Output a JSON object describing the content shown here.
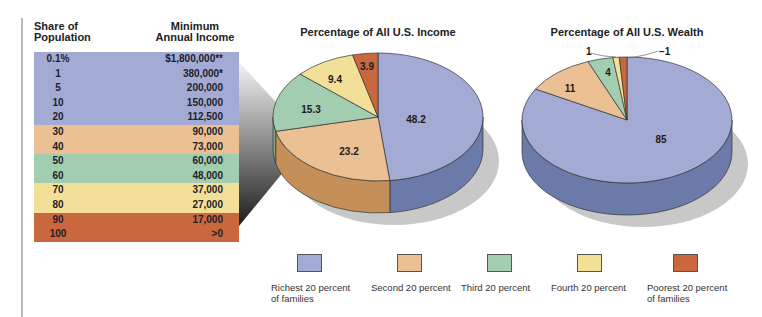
{
  "table": {
    "headers": {
      "share": [
        "Share of",
        "Population"
      ],
      "min_income": [
        "Minimum",
        "Annual Income"
      ]
    },
    "rows": [
      {
        "share": "0.1%",
        "income": "$1,800,000**",
        "group": "richest"
      },
      {
        "share": "1",
        "income": "380,000*",
        "group": "richest"
      },
      {
        "share": "5",
        "income": "200,000",
        "group": "richest"
      },
      {
        "share": "10",
        "income": "150,000",
        "group": "richest"
      },
      {
        "share": "20",
        "income": "112,500",
        "group": "richest"
      },
      {
        "share": "30",
        "income": "90,000",
        "group": "second"
      },
      {
        "share": "40",
        "income": "73,000",
        "group": "second"
      },
      {
        "share": "50",
        "income": "60,000",
        "group": "third"
      },
      {
        "share": "60",
        "income": "48,000",
        "group": "third"
      },
      {
        "share": "70",
        "income": "37,000",
        "group": "fourth"
      },
      {
        "share": "80",
        "income": "27,000",
        "group": "fourth"
      },
      {
        "share": "90",
        "income": "17,000",
        "group": "poorest"
      },
      {
        "share": "100",
        "income": ">0",
        "group": "poorest"
      }
    ]
  },
  "colors": {
    "richest": "#a3aad3",
    "second": "#ecc095",
    "third": "#a3cdb0",
    "fourth": "#f2df98",
    "poorest": "#c9683f"
  },
  "side_colors": {
    "richest": "#6b7aa8",
    "second": "#c48f59",
    "third": "#7da88a",
    "fourth": "#d2bd6c",
    "poorest": "#a44f2c"
  },
  "income_chart": {
    "title": "Percentage of All U.S. Income"
  },
  "wealth_chart": {
    "title": "Percentage of All U.S. Wealth"
  },
  "legend": [
    {
      "key": "richest",
      "label": "Richest 20 percent\nof families"
    },
    {
      "key": "second",
      "label": "Second 20 percent"
    },
    {
      "key": "third",
      "label": "Third 20 percent"
    },
    {
      "key": "fourth",
      "label": "Fourth 20 percent"
    },
    {
      "key": "poorest",
      "label": "Poorest 20 percent\nof families"
    }
  ],
  "chart_data": [
    {
      "type": "pie",
      "title": "Percentage of All U.S. Income",
      "categories": [
        "Richest 20 percent of families",
        "Second 20 percent",
        "Third 20 percent",
        "Fourth 20 percent",
        "Poorest 20 percent of families"
      ],
      "values": [
        48.2,
        23.2,
        15.3,
        9.4,
        3.9
      ],
      "labels": [
        "48.2",
        "23.2",
        "15.3",
        "9.4",
        "3.9"
      ],
      "style": "3d"
    },
    {
      "type": "pie",
      "title": "Percentage of All U.S. Wealth",
      "categories": [
        "Richest 20 percent of families",
        "Second 20 percent",
        "Third 20 percent",
        "Fourth 20 percent",
        "Poorest 20 percent of families"
      ],
      "values": [
        85,
        11,
        4,
        1,
        -1
      ],
      "labels": [
        "85",
        "11",
        "4",
        "1",
        "−1"
      ],
      "style": "3d",
      "note": "Poorest 20 percent slice labeled −1 (drawn as small slice)"
    },
    {
      "type": "table",
      "title": "Minimum Annual Income by Share of Population",
      "columns": [
        "Share of Population",
        "Minimum Annual Income"
      ],
      "rows": [
        [
          "0.1%",
          "$1,800,000**"
        ],
        [
          "1",
          "380,000*"
        ],
        [
          "5",
          "200,000"
        ],
        [
          "10",
          "150,000"
        ],
        [
          "20",
          "112,500"
        ],
        [
          "30",
          "90,000"
        ],
        [
          "40",
          "73,000"
        ],
        [
          "50",
          "60,000"
        ],
        [
          "60",
          "48,000"
        ],
        [
          "70",
          "37,000"
        ],
        [
          "80",
          "27,000"
        ],
        [
          "90",
          "17,000"
        ],
        [
          "100",
          ">0"
        ]
      ]
    }
  ]
}
